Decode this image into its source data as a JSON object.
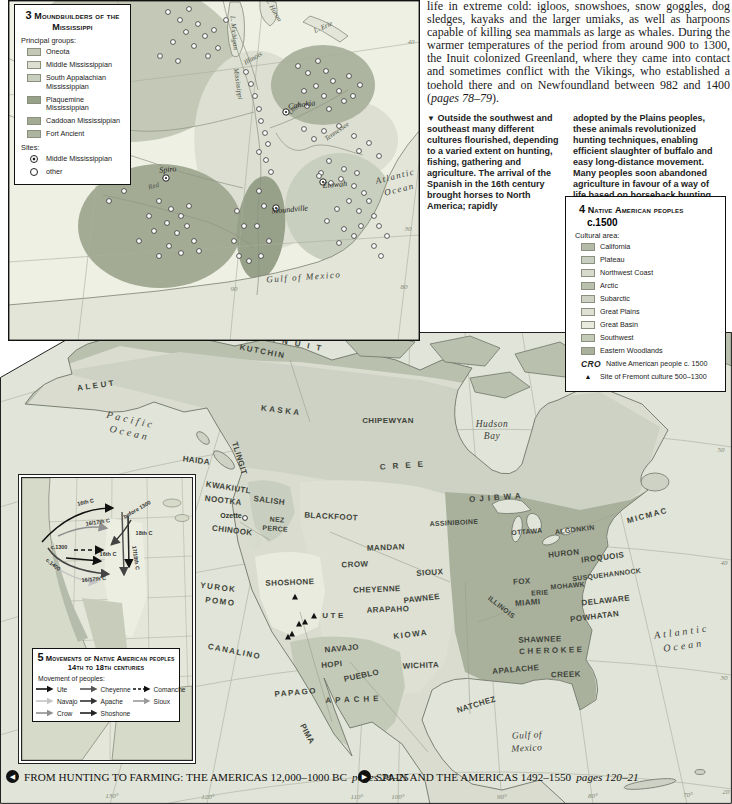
{
  "article": {
    "p1": "life in extreme cold: igloos, snowshoes, snow goggles, dog sledges, kayaks and the larger umiaks, as well as harpoons capable of killing sea mammals as large as whales. During the warmer temperatures of the period from around 900 to 1300, the Inuit colonized Greenland, where they came into contact and sometimes conflict with the Vikings, who established a toehold there and on Newfoundland between 982 and 1400 (",
    "pages_ref": "pages 78–79",
    "p2": ")."
  },
  "caption": {
    "marker": "▼",
    "col1": "Outside the southwest and southeast many different cultures flourished, depending to a varied extent on hunting, fishing, gathering and agriculture. The arrival of the Spanish in the 16th century brought horses to North America; rapidly",
    "col2": "adopted by the Plains peoples, these animals revolutionized hunting techniques, enabling efficient slaughter of buffalo and easy long-distance movement. Many peoples soon abandoned agriculture in favour of a way of life based on horseback hunting."
  },
  "map3": {
    "number": "3",
    "title": "Moundbuilders of the Mississippi",
    "legend": {
      "groups_label": "Principal groups:",
      "groups": [
        {
          "label": "Oneota",
          "color": "#c3c9b6"
        },
        {
          "label": "Middle Mississippian",
          "color": "#dcdfd1"
        },
        {
          "label": "South Appalachian Mississippian",
          "color": "#c9cfbe"
        },
        {
          "label": "Plaquemine Mississippian",
          "color": "#97a089"
        },
        {
          "label": "Caddoan Mississippian",
          "color": "#a4ab95"
        },
        {
          "label": "Fort Ancient",
          "color": "#adb49f"
        }
      ],
      "sites_label": "Sites:",
      "site_types": [
        {
          "label": "Middle Mississippian",
          "type": "double"
        },
        {
          "label": "other",
          "type": "single"
        }
      ]
    },
    "labels": [
      [
        "L. Michigan",
        224,
        33,
        85,
        "rl"
      ],
      [
        "L. Huron",
        264,
        11,
        60,
        "rl"
      ],
      [
        "L. Erie",
        316,
        29,
        -24,
        "rl"
      ],
      [
        "Illinois",
        246,
        60,
        -30,
        "rl"
      ],
      [
        "Missouri",
        22,
        72,
        55,
        "rl"
      ],
      [
        "Mississippi",
        228,
        84,
        82,
        "rl"
      ],
      [
        "Ohio",
        288,
        110,
        -45,
        "rl"
      ],
      [
        "Tennessee",
        330,
        133,
        -35,
        "rl"
      ],
      [
        "Arkansas",
        108,
        133,
        -28,
        "rl"
      ],
      [
        "Red",
        146,
        188,
        -15,
        "rl"
      ],
      [
        "Cahokia",
        294,
        107,
        -8,
        "pl"
      ],
      [
        "Spiro",
        160,
        172,
        -5,
        "pl"
      ],
      [
        "Etowah",
        327,
        187,
        -5,
        "pl"
      ],
      [
        "Moundville",
        282,
        212,
        -5,
        "pl"
      ],
      [
        "Atlantic",
        388,
        179,
        -14,
        "o3"
      ],
      [
        "Ocean",
        392,
        192,
        -14,
        "o3"
      ],
      [
        "Gulf of Mexico",
        296,
        280,
        -4,
        "o3"
      ],
      [
        "40",
        403,
        44,
        0,
        "g"
      ],
      [
        "30",
        400,
        231,
        0,
        "g"
      ],
      [
        "90",
        226,
        291,
        0,
        "g"
      ],
      [
        "80",
        396,
        289,
        0,
        "g"
      ]
    ],
    "sites": {
      "middle": [
        [
          278,
          112
        ],
        [
          158,
          178
        ],
        [
          315,
          182
        ],
        [
          268,
          208
        ]
      ],
      "other": [
        [
          160,
          12
        ],
        [
          172,
          20
        ],
        [
          181,
          9
        ],
        [
          190,
          24
        ],
        [
          178,
          32
        ],
        [
          165,
          42
        ],
        [
          186,
          46
        ],
        [
          197,
          36
        ],
        [
          152,
          56
        ],
        [
          170,
          61
        ],
        [
          200,
          56
        ],
        [
          210,
          48
        ],
        [
          206,
          30
        ],
        [
          218,
          20
        ],
        [
          238,
          72
        ],
        [
          243,
          84
        ],
        [
          247,
          96
        ],
        [
          251,
          109
        ],
        [
          253,
          121
        ],
        [
          257,
          133
        ],
        [
          260,
          144
        ],
        [
          251,
          152
        ],
        [
          258,
          160
        ],
        [
          263,
          172
        ],
        [
          290,
          66
        ],
        [
          300,
          73
        ],
        [
          310,
          61
        ],
        [
          318,
          71
        ],
        [
          325,
          81
        ],
        [
          308,
          86
        ],
        [
          296,
          91
        ],
        [
          316,
          96
        ],
        [
          331,
          91
        ],
        [
          341,
          76
        ],
        [
          336,
          101
        ],
        [
          299,
          106
        ],
        [
          321,
          109
        ],
        [
          345,
          96
        ],
        [
          352,
          85
        ],
        [
          296,
          129
        ],
        [
          306,
          139
        ],
        [
          316,
          131
        ],
        [
          331,
          126
        ],
        [
          346,
          136
        ],
        [
          351,
          151
        ],
        [
          361,
          143
        ],
        [
          371,
          156
        ],
        [
          321,
          161
        ],
        [
          336,
          169
        ],
        [
          349,
          173
        ],
        [
          313,
          173
        ],
        [
          311,
          176
        ],
        [
          323,
          183
        ],
        [
          333,
          179
        ],
        [
          346,
          186
        ],
        [
          356,
          193
        ],
        [
          341,
          201
        ],
        [
          329,
          209
        ],
        [
          351,
          211
        ],
        [
          361,
          201
        ],
        [
          319,
          221
        ],
        [
          336,
          229
        ],
        [
          346,
          236
        ],
        [
          331,
          243
        ],
        [
          353,
          226
        ],
        [
          366,
          216
        ],
        [
          151,
          201
        ],
        [
          163,
          209
        ],
        [
          173,
          216
        ],
        [
          159,
          223
        ],
        [
          146,
          231
        ],
        [
          169,
          233
        ],
        [
          179,
          226
        ],
        [
          186,
          241
        ],
        [
          161,
          246
        ],
        [
          173,
          253
        ],
        [
          151,
          256
        ],
        [
          141,
          216
        ],
        [
          131,
          241
        ],
        [
          181,
          206
        ],
        [
          191,
          251
        ],
        [
          251,
          191
        ],
        [
          256,
          206
        ],
        [
          249,
          226
        ],
        [
          261,
          241
        ],
        [
          253,
          256
        ],
        [
          241,
          261
        ],
        [
          231,
          256
        ],
        [
          226,
          241
        ],
        [
          236,
          226
        ],
        [
          229,
          211
        ],
        [
          371,
          226
        ],
        [
          379,
          236
        ],
        [
          366,
          246
        ],
        [
          373,
          256
        ],
        [
          61,
          131
        ],
        [
          76,
          143
        ],
        [
          91,
          151
        ],
        [
          106,
          161
        ],
        [
          51,
          156
        ],
        [
          116,
          191
        ],
        [
          101,
          201
        ]
      ]
    }
  },
  "legend4": {
    "number": "4",
    "title": "Native American peoples",
    "subtitle": "c.1500",
    "cultural_area_label": "Cultural area:",
    "areas": [
      {
        "label": "California",
        "color": "#b4bba9"
      },
      {
        "label": "Plateau",
        "color": "#c9cfc0"
      },
      {
        "label": "Northwest Coast",
        "color": "#d7dbcd"
      },
      {
        "label": "Arctic",
        "color": "#b9c0ae"
      },
      {
        "label": "Subarctic",
        "color": "#cdd2c4"
      },
      {
        "label": "Great Plains",
        "color": "#dde0d3"
      },
      {
        "label": "Great Basin",
        "color": "#e9ebde"
      },
      {
        "label": "Southwest",
        "color": "#c4cab8"
      },
      {
        "label": "Eastern Woodlands",
        "color": "#a9b19d"
      }
    ],
    "cro_abbrev": "CRO",
    "cro_label": "Native American people c. 1500",
    "fremont_marker": "▲",
    "fremont_label": "Site of Fremont culture 500–1300"
  },
  "main_map": {
    "labels": [
      [
        "INUIT",
        300,
        15,
        11,
        "t sp4"
      ],
      [
        "KUTCHIN",
        262,
        22,
        11,
        "t sp1"
      ],
      [
        "ALEUT",
        97,
        56,
        -8,
        "t sp2"
      ],
      [
        "KASKA",
        281,
        81,
        7,
        "t sp2"
      ],
      [
        "CHIPEWYAN",
        388,
        91,
        0,
        "t"
      ],
      [
        "TLINGIT",
        237,
        127,
        73,
        "t"
      ],
      [
        "HAIDA",
        196,
        131,
        7,
        "t"
      ],
      [
        "KWAKIUTL",
        228,
        158,
        9,
        "t"
      ],
      [
        "NOOTKA",
        223,
        171,
        7,
        "t"
      ],
      [
        "SALISH",
        269,
        171,
        7,
        "t"
      ],
      [
        "CHINOOK",
        232,
        201,
        7,
        "t"
      ],
      [
        "NEZ",
        277,
        190,
        4,
        "t7"
      ],
      [
        "PERCE",
        275,
        199,
        4,
        "t7"
      ],
      [
        "BLACKFOOT",
        331,
        187,
        3,
        "t"
      ],
      [
        "CREE",
        405,
        136,
        -4,
        "t sp4"
      ],
      [
        "OJIBWA",
        497,
        168,
        -4,
        "t sp3"
      ],
      [
        "ASSINIBOINE",
        454,
        193,
        -3,
        "t7"
      ],
      [
        "MICMAC",
        648,
        186,
        -15,
        "t sp1"
      ],
      [
        "OTTAWA",
        527,
        202,
        -5,
        "t7"
      ],
      [
        "ALGONKIN",
        575,
        200,
        -7,
        "t7"
      ],
      [
        "HURON",
        564,
        224,
        -6,
        "t"
      ],
      [
        "IROQUOIS",
        603,
        228,
        -7,
        "t"
      ],
      [
        "SUSQUEHANNOCK",
        607,
        245,
        -7,
        "t7"
      ],
      [
        "MOHAWK",
        568,
        256,
        -5,
        "t7"
      ],
      [
        "FOX",
        522,
        252,
        -4,
        "t"
      ],
      [
        "ERIE",
        540,
        263,
        -4,
        "t7"
      ],
      [
        "ILLINOIS",
        500,
        277,
        38,
        "t7"
      ],
      [
        "MIAMI",
        528,
        273,
        -4,
        "t"
      ],
      [
        "DELAWARE",
        606,
        271,
        -6,
        "t"
      ],
      [
        "POWHATAN",
        595,
        287,
        -7,
        "t"
      ],
      [
        "MANDAN",
        386,
        218,
        -2,
        "t"
      ],
      [
        "CROW",
        355,
        235,
        -2,
        "t"
      ],
      [
        "SIOUX",
        430,
        243,
        -4,
        "t"
      ],
      [
        "SHOSHONE",
        290,
        253,
        -2,
        "t"
      ],
      [
        "CHEYENNE",
        377,
        260,
        -2,
        "t"
      ],
      [
        "PAWNEE",
        422,
        269,
        -7,
        "t"
      ],
      [
        "ARAPAHO",
        388,
        280,
        -2,
        "t"
      ],
      [
        "UTE",
        334,
        286,
        0,
        "t sp2"
      ],
      [
        "YUROK",
        218,
        258,
        7,
        "t sp1"
      ],
      [
        "POMO",
        220,
        272,
        7,
        "t sp1"
      ],
      [
        "KIOWA",
        411,
        305,
        -7,
        "t sp1"
      ],
      [
        "SHAWNEE",
        540,
        310,
        -2,
        "t"
      ],
      [
        "CHEROKEE",
        552,
        321,
        -2,
        "t sp2"
      ],
      [
        "CANALINO",
        234,
        322,
        11,
        "t sp1"
      ],
      [
        "NAVAJO",
        342,
        319,
        -5,
        "t"
      ],
      [
        "HOPI",
        332,
        335,
        -5,
        "t"
      ],
      [
        "PUEBLO",
        362,
        346,
        -12,
        "t"
      ],
      [
        "WICHITA",
        421,
        336,
        -2,
        "t"
      ],
      [
        "APALACHE",
        516,
        340,
        -5,
        "t"
      ],
      [
        "CREEK",
        566,
        345,
        -2,
        "t"
      ],
      [
        "PAPAGO",
        296,
        363,
        -5,
        "t sp1"
      ],
      [
        "APACHE",
        354,
        370,
        -2,
        "t sp3"
      ],
      [
        "PIMA",
        305,
        403,
        62,
        "t"
      ],
      [
        "NATCHEZ",
        477,
        375,
        -17,
        "t"
      ],
      [
        "Ozette",
        231,
        186,
        0,
        "sl"
      ],
      [
        "Pacific",
        130,
        91,
        13,
        "o"
      ],
      [
        "Ocean",
        129,
        104,
        13,
        "o"
      ],
      [
        "Hudson",
        492,
        95,
        0,
        "w"
      ],
      [
        "Bay",
        492,
        107,
        0,
        "w"
      ],
      [
        "Atlantic",
        682,
        303,
        -8,
        "o"
      ],
      [
        "Ocean",
        684,
        317,
        -8,
        "o"
      ],
      [
        "Gulf of",
        527,
        406,
        -3,
        "w"
      ],
      [
        "Mexico",
        527,
        419,
        -3,
        "w"
      ],
      [
        "50",
        721,
        120,
        0,
        "g"
      ],
      [
        "40",
        724,
        233,
        0,
        "g"
      ],
      [
        "30",
        724,
        348,
        0,
        "g"
      ],
      [
        "20",
        726,
        462,
        0,
        "g"
      ],
      [
        "130°",
        112,
        466,
        0,
        "g"
      ],
      [
        "120°",
        208,
        467,
        0,
        "g"
      ],
      [
        "110°",
        357,
        467,
        0,
        "g"
      ],
      [
        "100°",
        398,
        467,
        0,
        "g"
      ],
      [
        "90°",
        502,
        467,
        0,
        "g"
      ],
      [
        "80°",
        593,
        466,
        0,
        "g"
      ],
      [
        "70°",
        688,
        465,
        0,
        "g"
      ]
    ],
    "fremont_sites": [
      [
        295,
        265
      ],
      [
        314,
        284
      ],
      [
        299,
        292
      ],
      [
        305,
        290
      ],
      [
        292,
        302
      ],
      [
        288,
        305
      ]
    ],
    "ozette_point": {
      "x": 245,
      "y": 186
    }
  },
  "inset5": {
    "number": "5",
    "title": "Movements of Native American peoples 14th to 18th centuries",
    "movement_label": "Movement of peoples:",
    "movements": [
      {
        "label": "Ute",
        "color": "#111111",
        "dash": ""
      },
      {
        "label": "Navajo",
        "color": "#c4c4c4",
        "dash": ""
      },
      {
        "label": "Crow",
        "color": "#8f8f8f",
        "dash": ""
      },
      {
        "label": "Cheyenne",
        "color": "#555555",
        "dash": ""
      },
      {
        "label": "Apache",
        "color": "#333333",
        "dash": ""
      },
      {
        "label": "Shoshone",
        "color": "#222222",
        "dash": ""
      },
      {
        "label": "Comanche",
        "color": "#111111",
        "dash": "3 2"
      },
      {
        "label": "Sioux",
        "color": "#999999",
        "dash": ""
      }
    ],
    "arrows": [
      {
        "d": "M20,64 Q50,30 90,30",
        "c": "#111111",
        "dash": "",
        "m": "black"
      },
      {
        "d": "M36,58 Q62,46 84,50",
        "c": "#8f8f8f",
        "dash": "",
        "m": "mid"
      },
      {
        "d": "M100,34 L102,96",
        "c": "#555555",
        "dash": "",
        "m": "dark"
      },
      {
        "d": "M106,38 L107,88",
        "c": "#222222",
        "dash": "",
        "m": "black"
      },
      {
        "d": "M109,42 Q101,56 90,66",
        "c": "#333333",
        "dash": "",
        "m": "dark"
      },
      {
        "d": "M44,80 L78,83",
        "c": "#111111",
        "dash": "",
        "m": "black"
      },
      {
        "d": "M26,70 Q40,92 86,96",
        "c": "#444444",
        "dash": "",
        "m": "dark"
      },
      {
        "d": "M30,86 Q50,102 74,104",
        "c": "#c4c4c4",
        "dash": "",
        "m": "light"
      },
      {
        "d": "M52,72 L80,72",
        "c": "#111111",
        "dash": "4 3",
        "m": "black"
      }
    ],
    "arrow_labels": [
      [
        "16th C",
        64,
        26,
        -12,
        "i5"
      ],
      [
        "16/17th C",
        76,
        46,
        -8,
        "i5"
      ],
      [
        "before 1300",
        116,
        33,
        -30,
        "i5"
      ],
      [
        "18th C",
        122,
        57,
        0,
        "i5"
      ],
      [
        "c.1300",
        37,
        71,
        0,
        "i5"
      ],
      [
        "16th C",
        86,
        78,
        0,
        "i5"
      ],
      [
        "c.1400",
        30,
        88,
        38,
        "i5"
      ],
      [
        "17/18th C",
        112,
        80,
        82,
        "i5"
      ],
      [
        "16/17th C",
        72,
        103,
        -5,
        "i5"
      ]
    ]
  },
  "footer": {
    "left_icon": "◀",
    "left_text": "FROM HUNTING TO FARMING: THE AMERICAS 12,000–1000 BC",
    "left_pages": "pages 24–25",
    "right_icon": "▶",
    "right_text": "SPAIN AND THE AMERICAS 1492–1550",
    "right_pages": "pages 120–21"
  }
}
